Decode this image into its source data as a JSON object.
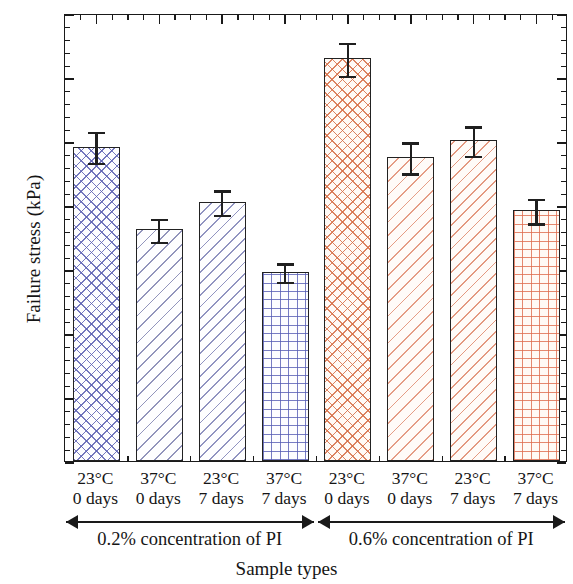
{
  "chart_data": {
    "type": "bar",
    "title": "",
    "xlabel": "Sample types",
    "ylabel": "Failure stress (kPa)",
    "ylim": [
      0,
      70
    ],
    "ytick_labels": [
      "0.0",
      "10",
      "20",
      "30",
      "40",
      "50",
      "60",
      "70"
    ],
    "ytick_values": [
      0,
      10,
      20,
      30,
      40,
      50,
      60,
      70
    ],
    "y_minor_step": 2,
    "grid": false,
    "legend": null,
    "categories": [
      "23°C\n0 days",
      "37°C\n0 days",
      "23°C\n7 days",
      "37°C\n7 days",
      "23°C\n0 days",
      "37°C\n0 days",
      "23°C\n7 days",
      "37°C\n7 days"
    ],
    "values": [
      49.1,
      36.2,
      40.5,
      29.6,
      62.9,
      47.5,
      50.1,
      39.2
    ],
    "errors": [
      2.6,
      2.0,
      2.1,
      1.6,
      2.8,
      2.6,
      2.5,
      2.1
    ],
    "bars": [
      {
        "label_top": "23°C",
        "label_bottom": "0 days",
        "value": 49.1,
        "error": 2.6,
        "pattern": "crosshatch",
        "color": "#5c60b2",
        "group": "0.2% concentration of PI"
      },
      {
        "label_top": "37°C",
        "label_bottom": "0 days",
        "value": 36.2,
        "error": 2.0,
        "pattern": "diagonal",
        "color": "#6e71a5",
        "group": "0.2% concentration of PI"
      },
      {
        "label_top": "23°C",
        "label_bottom": "7 days",
        "value": 40.5,
        "error": 2.1,
        "pattern": "diagonal-dense",
        "color": "#6c70ac",
        "group": "0.2% concentration of PI"
      },
      {
        "label_top": "37°C",
        "label_bottom": "7 days",
        "value": 29.6,
        "error": 1.6,
        "pattern": "grid",
        "color": "#565cb4",
        "group": "0.2% concentration of PI"
      },
      {
        "label_top": "23°C",
        "label_bottom": "0 days",
        "value": 62.9,
        "error": 2.8,
        "pattern": "crosshatch",
        "color": "#d66e46",
        "group": "0.6% concentration of PI"
      },
      {
        "label_top": "37°C",
        "label_bottom": "0 days",
        "value": 47.5,
        "error": 2.6,
        "pattern": "diagonal",
        "color": "#dc7d5f",
        "group": "0.6% concentration of PI"
      },
      {
        "label_top": "23°C",
        "label_bottom": "7 days",
        "value": 50.1,
        "error": 2.5,
        "pattern": "diagonal-dense",
        "color": "#da7858",
        "group": "0.6% concentration of PI"
      },
      {
        "label_top": "37°C",
        "label_bottom": "7 days",
        "value": 39.2,
        "error": 2.1,
        "pattern": "grid",
        "color": "#de6c4e",
        "group": "0.6% concentration of PI"
      }
    ],
    "groups": [
      {
        "label": "0.2% concentration of PI",
        "bar_indices": [
          0,
          1,
          2,
          3
        ]
      },
      {
        "label": "0.6% concentration of PI",
        "bar_indices": [
          4,
          5,
          6,
          7
        ]
      }
    ],
    "colors": {
      "blue": "#5c60b2",
      "orange": "#d66e46",
      "axis": "#1a1a1a"
    }
  }
}
